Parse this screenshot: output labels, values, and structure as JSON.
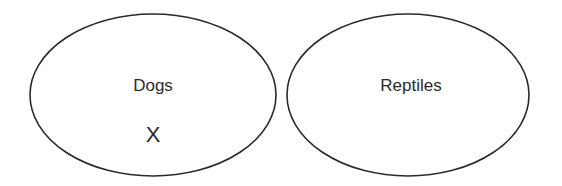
{
  "diagram": {
    "type": "venn-like-separate-sets",
    "stroke_color": "#2a2a2a",
    "sets": [
      {
        "label": "Dogs",
        "members": [
          "X"
        ]
      },
      {
        "label": "Reptiles",
        "members": []
      }
    ]
  }
}
